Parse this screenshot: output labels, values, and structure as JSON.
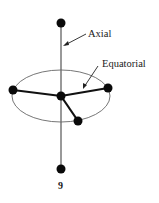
{
  "figure": {
    "number_label": "9",
    "labels": {
      "axial": "Axial",
      "equatorial": "Equatorial"
    },
    "colors": {
      "atom": "#0a0a0a",
      "axis": "#555555",
      "ellipse": "#666666",
      "bond": "#111111"
    },
    "geometry": "trigonal-bipyramidal",
    "atoms": [
      {
        "name": "axial-top",
        "x": 61,
        "y": 23
      },
      {
        "name": "central",
        "x": 61,
        "y": 96
      },
      {
        "name": "equatorial-left",
        "x": 13,
        "y": 90
      },
      {
        "name": "equatorial-right",
        "x": 108,
        "y": 88
      },
      {
        "name": "equatorial-front",
        "x": 78,
        "y": 121
      },
      {
        "name": "axial-bottom",
        "x": 61,
        "y": 169
      }
    ]
  }
}
